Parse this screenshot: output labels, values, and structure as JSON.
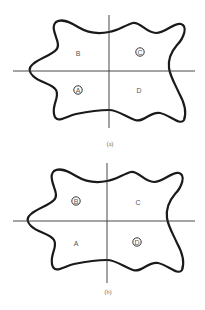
{
  "figure": {
    "panels": [
      {
        "caption": "(a)",
        "quadrants": {
          "top_left": {
            "label": "B",
            "circled": false
          },
          "top_right": {
            "label": "C",
            "circled": true
          },
          "bottom_left": {
            "label": "A",
            "circled": true
          },
          "bottom_right": {
            "label": "D",
            "circled": false
          }
        }
      },
      {
        "caption": "(b)",
        "quadrants": {
          "top_left": {
            "label": "B",
            "circled": true
          },
          "top_right": {
            "label": "C",
            "circled": false
          },
          "bottom_left": {
            "label": "A",
            "circled": false
          },
          "bottom_right": {
            "label": "D",
            "circled": true
          }
        }
      }
    ]
  }
}
